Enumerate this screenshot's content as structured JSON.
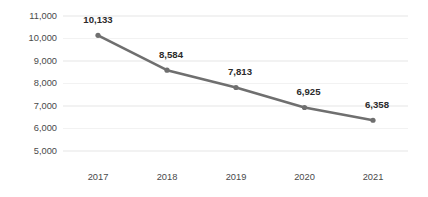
{
  "chart_data": {
    "type": "line",
    "title": "",
    "subtitle": "",
    "xlabel": "",
    "ylabel": "",
    "categories": [
      "2017",
      "2018",
      "2019",
      "2020",
      "2021"
    ],
    "values": [
      10133,
      8584,
      7813,
      6925,
      6358
    ],
    "value_labels": [
      "10,133",
      "8,584",
      "7,813",
      "6,925",
      "6,358"
    ],
    "ylim": [
      5000,
      11000
    ],
    "ytick_values": [
      11000,
      10000,
      9000,
      8000,
      7000,
      6000,
      5000
    ],
    "ytick_labels": [
      "11,000",
      "10,000",
      "9,000",
      "8,000",
      "7,000",
      "6,000",
      "5,000"
    ],
    "grid": "horizontal",
    "legend": "none",
    "series": [
      {
        "name": "",
        "values": [
          10133,
          8584,
          7813,
          6925,
          6358
        ]
      }
    ],
    "colors": {
      "line": "#6f6f6f",
      "marker": "#6f6f6f",
      "gridline": "#f2f2f2",
      "tick_text": "#4a4a4a",
      "label_text": "#2b2b2b",
      "background": "#ffffff"
    }
  }
}
